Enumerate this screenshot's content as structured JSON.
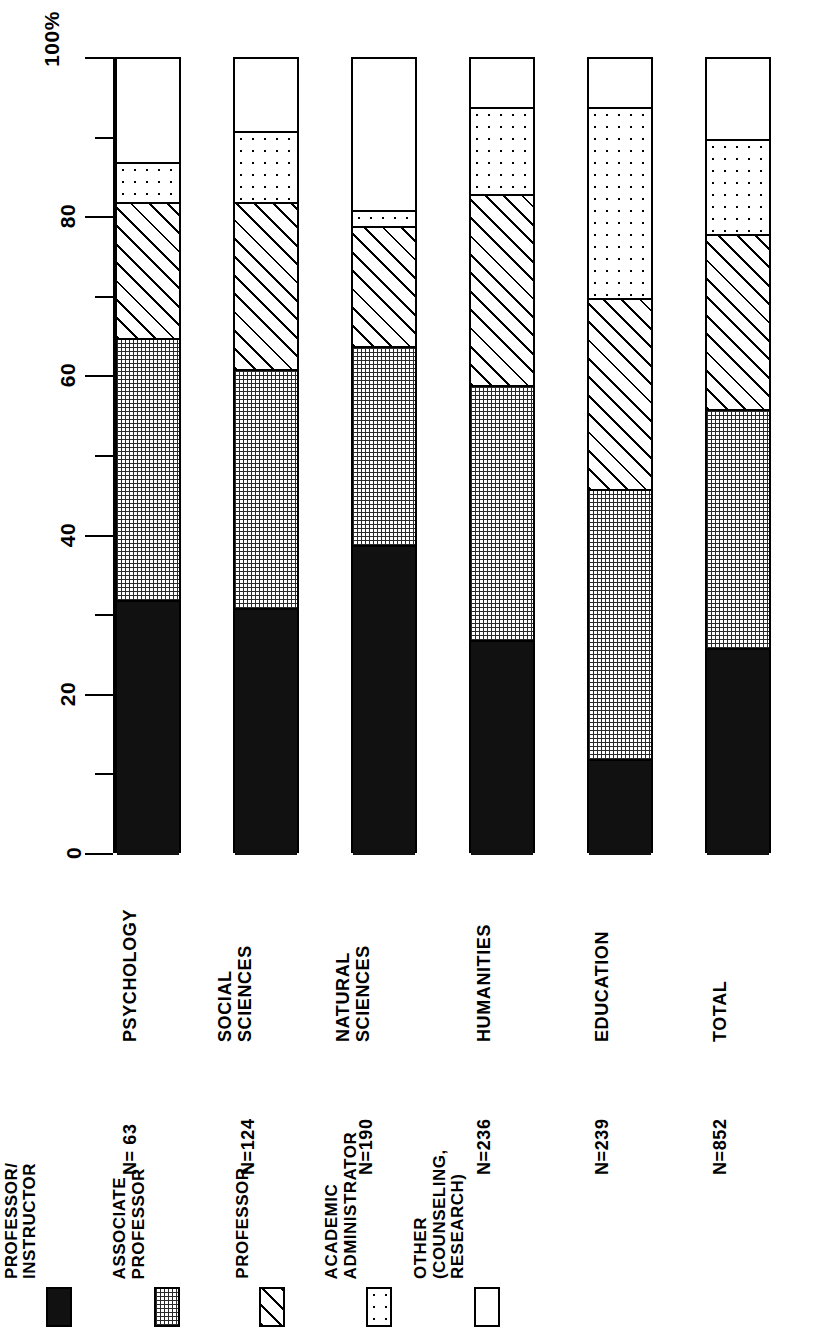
{
  "chart_data": {
    "type": "bar",
    "orientation": "vertical-stacked-rotated",
    "title": "",
    "xlabel": "",
    "ylabel": "100%",
    "ylim": [
      0,
      100
    ],
    "grid": false,
    "legend_position": "bottom-left",
    "axis": {
      "unit_label": "100%",
      "major_ticks": [
        0,
        20,
        40,
        60,
        80,
        100
      ],
      "major_tick_labels": [
        "0",
        "20",
        "40",
        "60",
        "80",
        "100%"
      ],
      "minor_ticks": [
        10,
        30,
        50,
        70,
        90
      ]
    },
    "categories": [
      "PSYCHOLOGY",
      "SOCIAL\nSCIENCES",
      "NATURAL\nSCIENCES",
      "HUMANITIES",
      "EDUCATION",
      "TOTAL"
    ],
    "category_counts": [
      "N= 63",
      "N=124",
      "N=190",
      "N=236",
      "N=239",
      "N=852"
    ],
    "series": [
      {
        "name": "ASSISTANT PROFESSOR/ INSTRUCTOR",
        "pattern": "solid",
        "values": [
          32,
          31,
          39,
          27,
          12,
          26
        ]
      },
      {
        "name": "ASSOCIATE PROFESSOR",
        "pattern": "grid",
        "values": [
          33,
          30,
          25,
          32,
          34,
          30
        ]
      },
      {
        "name": "PROFESSOR",
        "pattern": "hatch",
        "values": [
          17,
          21,
          15,
          24,
          24,
          22
        ]
      },
      {
        "name": "ACADEMIC ADMINISTRATOR",
        "pattern": "dots",
        "values": [
          5,
          9,
          2,
          11,
          24,
          12
        ]
      },
      {
        "name": "OTHER (COUNSELING, RESEARCH)",
        "pattern": "white",
        "values": [
          13,
          9,
          19,
          6,
          6,
          10
        ]
      }
    ]
  },
  "axis_labels": {
    "t0": "0",
    "t20": "20",
    "t40": "40",
    "t60": "60",
    "t80": "80",
    "t100": "100%"
  },
  "bars": [
    {
      "label": "PSYCHOLOGY",
      "label_line2": "",
      "n": "N= 63"
    },
    {
      "label": "SOCIAL",
      "label_line2": "SCIENCES",
      "n": "N=124"
    },
    {
      "label": "NATURAL",
      "label_line2": "SCIENCES",
      "n": "N=190"
    },
    {
      "label": "HUMANITIES",
      "label_line2": "",
      "n": "N=236"
    },
    {
      "label": "EDUCATION",
      "label_line2": "",
      "n": "N=239"
    },
    {
      "label": "TOTAL",
      "label_line2": "",
      "n": "N=852"
    }
  ],
  "legend": {
    "items": [
      {
        "line1": "ASSISTANT",
        "line2": "PROFESSOR/",
        "line3": "INSTRUCTOR",
        "pattern": "solid"
      },
      {
        "line1": "ASSOCIATE",
        "line2": "PROFESSOR",
        "line3": "",
        "pattern": "grid"
      },
      {
        "line1": "PROFESSOR",
        "line2": "",
        "line3": "",
        "pattern": "hatch"
      },
      {
        "line1": "ACADEMIC",
        "line2": "ADMINISTRATOR",
        "line3": "",
        "pattern": "dots"
      },
      {
        "line1": "OTHER",
        "line2": "(COUNSELING,",
        "line3": "RESEARCH)",
        "pattern": "white"
      }
    ]
  },
  "colors": {
    "ink": "#000000",
    "paper": "#ffffff",
    "solid_fill": "#111111",
    "grid_fill": "#2a2a2a"
  }
}
